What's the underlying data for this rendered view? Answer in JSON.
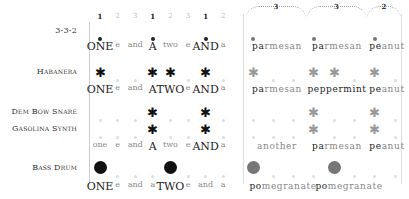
{
  "header": {
    "counts": [
      "1",
      "2",
      "3",
      "1",
      "2",
      "3",
      "1",
      "2"
    ],
    "accent": [
      true,
      false,
      false,
      true,
      false,
      false,
      true,
      false
    ],
    "brackets": [
      "3",
      "3",
      "2"
    ]
  },
  "rows": [
    {
      "label": "3-3-2",
      "pattern": "dots",
      "hits": [
        0,
        3,
        6
      ],
      "hits2": [
        0,
        3,
        6
      ],
      "words": [
        "ONE",
        "e",
        "and",
        "A",
        "two",
        "e",
        "AND",
        "a"
      ],
      "words_emph": [
        true,
        false,
        false,
        true,
        false,
        false,
        true,
        false
      ],
      "words2": [
        {
          "strong": "pa",
          "rest": "rmesan"
        },
        {
          "strong": "pa",
          "rest": "rmesan"
        },
        {
          "strong": "pe",
          "rest": "anut"
        }
      ]
    },
    {
      "label": "Habanera",
      "pattern": "stars",
      "hits": [
        0,
        3,
        4,
        6
      ],
      "hits2": [
        0,
        3,
        4,
        6
      ],
      "words": [
        "ONE",
        "e",
        "and",
        "A",
        "TWO",
        "e",
        "AND",
        "a"
      ],
      "words_emph": [
        true,
        false,
        false,
        true,
        true,
        false,
        true,
        false
      ],
      "words2": [
        {
          "strong": "pa",
          "rest": "rmesan"
        },
        {
          "strong": "peppermint",
          "rest": ""
        },
        {
          "strong": "pe",
          "rest": "anut"
        }
      ]
    },
    {
      "label": "Dem Bow Snare",
      "pattern": "stars",
      "hits": [
        3,
        6
      ],
      "hits2": [
        3,
        6
      ]
    },
    {
      "label": "Gasolina Synth",
      "pattern": "stars",
      "hits": [
        3,
        6
      ],
      "hits2": [
        3,
        6
      ],
      "words": [
        "one",
        "e",
        "and",
        "A",
        "two",
        "e",
        "AND",
        "a"
      ],
      "words_emph": [
        false,
        false,
        false,
        true,
        false,
        false,
        true,
        false
      ],
      "words2": [
        {
          "strong": "",
          "rest": "another"
        },
        {
          "strong": "pa",
          "rest": "rmesan"
        },
        {
          "strong": "pe",
          "rest": "anut"
        }
      ]
    },
    {
      "label": "Bass Drum",
      "pattern": "big",
      "hits": [
        0,
        4
      ],
      "hits2": [
        0,
        4
      ],
      "words": [
        "ONE",
        "e",
        "and",
        "a",
        "TWO",
        "e",
        "and",
        "a"
      ],
      "words_emph": [
        true,
        false,
        false,
        false,
        true,
        false,
        false,
        false
      ],
      "words2": [
        {
          "strong": "po",
          "rest": "megranate"
        },
        {
          "strong": "po",
          "rest": "megranate"
        }
      ]
    }
  ]
}
